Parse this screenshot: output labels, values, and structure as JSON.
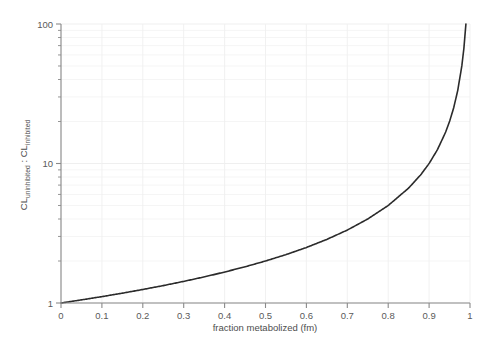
{
  "chart_data": {
    "type": "line",
    "title": "",
    "xlabel": "fraction metabolized (fm)",
    "ylabel_parts": {
      "main1": "CL",
      "sub1": "uninhibited",
      "separator": " : ",
      "main2": "CL",
      "sub2": "inhibited"
    },
    "ylabel": "CLuninhibited : CLinhibited",
    "xscale": "linear",
    "yscale": "log",
    "xlim": [
      0,
      1
    ],
    "ylim": [
      1,
      100
    ],
    "grid": true,
    "legend": false,
    "x_ticks": [
      "0",
      "0.1",
      "0.2",
      "0.3",
      "0.4",
      "0.5",
      "0.6",
      "0.7",
      "0.8",
      "0.9",
      "1"
    ],
    "x_tick_values": [
      0,
      0.1,
      0.2,
      0.3,
      0.4,
      0.5,
      0.6,
      0.7,
      0.8,
      0.9,
      1
    ],
    "y_ticks": [
      "1",
      "10",
      "100"
    ],
    "y_tick_values": [
      1,
      10,
      100
    ],
    "y_minor_ticks": [
      2,
      3,
      4,
      5,
      6,
      7,
      8,
      9,
      20,
      30,
      40,
      50,
      60,
      70,
      80,
      90
    ],
    "series": [
      {
        "name": "CL ratio = 1 / (1 - fm)",
        "x": [
          0,
          0.05,
          0.1,
          0.15,
          0.2,
          0.25,
          0.3,
          0.35,
          0.4,
          0.45,
          0.5,
          0.55,
          0.6,
          0.65,
          0.7,
          0.75,
          0.8,
          0.85,
          0.88,
          0.9,
          0.92,
          0.94,
          0.95,
          0.96,
          0.97,
          0.98,
          0.985,
          0.99
        ],
        "values": [
          1.0,
          1.053,
          1.111,
          1.176,
          1.25,
          1.333,
          1.429,
          1.538,
          1.667,
          1.818,
          2.0,
          2.222,
          2.5,
          2.857,
          3.333,
          4.0,
          5.0,
          6.667,
          8.333,
          10.0,
          12.5,
          16.667,
          20.0,
          25.0,
          33.333,
          50.0,
          66.667,
          100.0
        ],
        "color": "#2b2b2b",
        "linewidth": 1.6
      }
    ],
    "colors": {
      "curve": "#2b2b2b",
      "axis": "#8a8a8a",
      "grid": "#f0f0f0",
      "text": "#555555",
      "background": "#ffffff"
    }
  }
}
